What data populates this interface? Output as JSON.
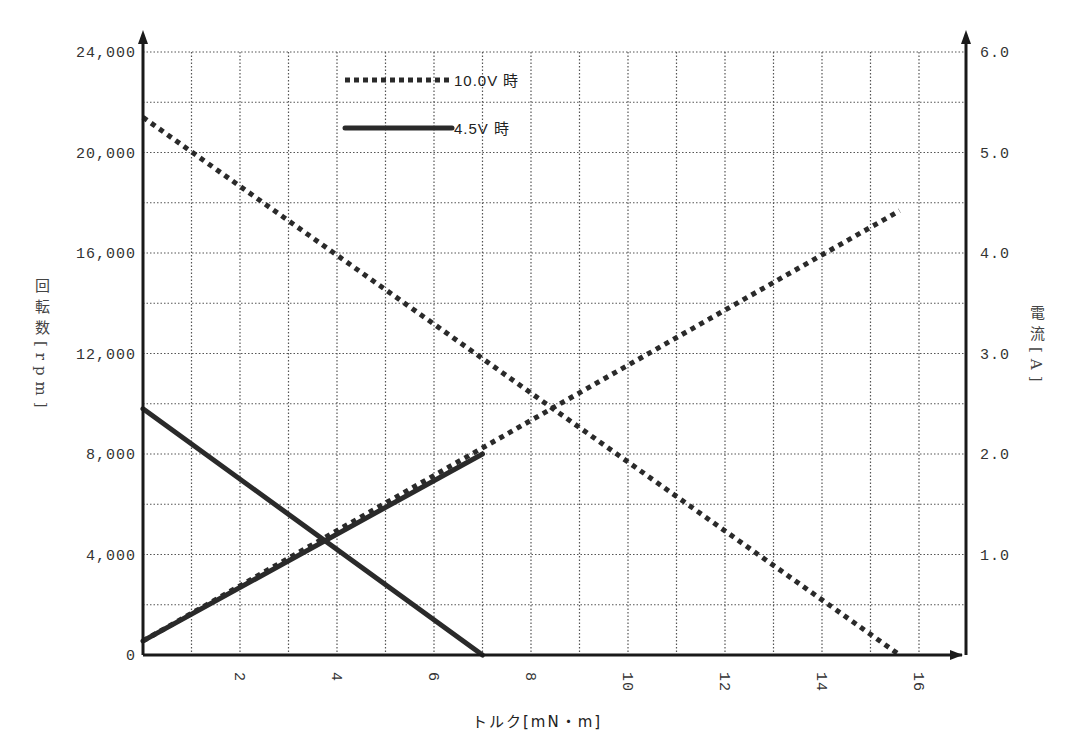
{
  "chart_data": {
    "type": "line",
    "title": "",
    "xlabel": "トルク[mN・m]",
    "ylabel": "回転数[rpm]",
    "y2label": "電流[A]",
    "xlim": [
      0,
      17
    ],
    "ylim": [
      0,
      24000
    ],
    "y2lim": [
      0,
      6.0
    ],
    "x_ticks": [
      2,
      4,
      6,
      8,
      10,
      12,
      14,
      16
    ],
    "x_tick_labels": [
      "2",
      "4",
      "6",
      "8",
      "10",
      "12",
      "14",
      "16"
    ],
    "x_minor_grid_step": 1,
    "y_ticks": [
      0,
      4000,
      8000,
      12000,
      16000,
      20000,
      24000
    ],
    "y_tick_labels": [
      "0",
      "4,000",
      "8,000",
      "12,000",
      "16,000",
      "20,000",
      "24,000"
    ],
    "y_minor_grid_step": 2000,
    "y2_ticks": [
      1.0,
      2.0,
      3.0,
      4.0,
      5.0,
      6.0
    ],
    "y2_tick_labels": [
      "1.0",
      "2.0",
      "3.0",
      "4.0",
      "5.0",
      "6.0"
    ],
    "grid": true,
    "legend_position": "upper-left-inside",
    "legend": [
      {
        "label": "10.0V 時",
        "style": "dotted"
      },
      {
        "label": "4.5V 時",
        "style": "solid"
      }
    ],
    "series": [
      {
        "name": "10.0V 時 回転数",
        "axis": "left",
        "style": "dotted",
        "x": [
          0,
          15.6
        ],
        "y": [
          21400,
          0
        ]
      },
      {
        "name": "10.0V 時 電流",
        "axis": "right",
        "style": "dotted",
        "x": [
          0,
          15.6
        ],
        "y": [
          0.14,
          4.42
        ]
      },
      {
        "name": "4.5V 時 回転数",
        "axis": "left",
        "style": "solid",
        "x": [
          0,
          7.0
        ],
        "y": [
          9800,
          0
        ]
      },
      {
        "name": "4.5V 時 電流",
        "axis": "right",
        "style": "solid",
        "x": [
          0,
          7.0
        ],
        "y": [
          0.14,
          2.0
        ]
      }
    ]
  },
  "labels": {
    "xtitle": "トルク[mN・m]",
    "ytitle": "回転数[rpm]",
    "y2title": "電流[A]"
  },
  "colors": {
    "line": "#2a2a2a",
    "grid": "#555555",
    "axis": "#1a1a1a"
  }
}
